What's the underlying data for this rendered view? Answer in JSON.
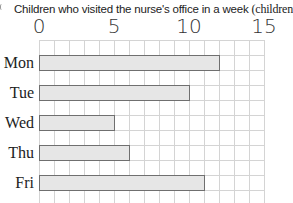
{
  "chart_data": {
    "type": "bar",
    "orientation": "horizontal",
    "title": "Children who visited the nurse's office in a week",
    "unit_label": "(children)",
    "categories": [
      "Mon",
      "Tue",
      "Wed",
      "Thu",
      "Fri"
    ],
    "values": [
      12,
      10,
      5,
      6,
      11
    ],
    "xlabel": "",
    "ylabel": "",
    "xlim": [
      0,
      15
    ],
    "x_ticks": [
      0,
      5,
      10,
      15
    ],
    "tick_labels": [
      "0",
      "5",
      "10",
      "15"
    ],
    "grid": true,
    "grid_step": 1,
    "colors": {
      "bar_fill": "#e6e6e6",
      "bar_border": "#6f6f6f",
      "grid": "#d4d4d4"
    }
  }
}
